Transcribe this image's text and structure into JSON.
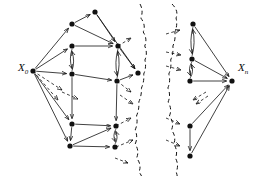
{
  "figure": {
    "type": "directed-graph-diagram",
    "background": "#ffffff",
    "ink_color": "#111111",
    "width": 260,
    "height": 176
  },
  "labels": {
    "source": {
      "base": "X",
      "sub": "0",
      "text": "X0"
    },
    "sink": {
      "base": "X",
      "sub": "n",
      "text": "Xn"
    }
  },
  "graph_data": {
    "type": "directed-graph",
    "node_style": {
      "shape": "filled-circle",
      "radius": 2.6,
      "color": "#111111"
    },
    "edge_style": {
      "color": "#111111",
      "width": 0.8,
      "arrowhead": "open-v"
    },
    "break_line_style": {
      "dash": "4 3",
      "color": "#111111",
      "width": 1.0
    },
    "nodes": [
      {
        "id": "x0",
        "x": 33,
        "y": 71,
        "label": "X0",
        "label_pos": "left"
      },
      {
        "id": "a1",
        "x": 95,
        "y": 12,
        "label": ""
      },
      {
        "id": "a2",
        "x": 72,
        "y": 24,
        "label": ""
      },
      {
        "id": "a3",
        "x": 72,
        "y": 46,
        "label": ""
      },
      {
        "id": "a4",
        "x": 118,
        "y": 46,
        "label": ""
      },
      {
        "id": "a5",
        "x": 72,
        "y": 74,
        "label": ""
      },
      {
        "id": "a6",
        "x": 117,
        "y": 81,
        "label": ""
      },
      {
        "id": "a7",
        "x": 138,
        "y": 73,
        "label": ""
      },
      {
        "id": "b1",
        "x": 72,
        "y": 124,
        "label": ""
      },
      {
        "id": "b2",
        "x": 70,
        "y": 146,
        "label": ""
      },
      {
        "id": "b3",
        "x": 116,
        "y": 126,
        "label": ""
      },
      {
        "id": "b4",
        "x": 115,
        "y": 147,
        "label": ""
      },
      {
        "id": "r1",
        "x": 193,
        "y": 24,
        "label": ""
      },
      {
        "id": "r2",
        "x": 192,
        "y": 59,
        "label": ""
      },
      {
        "id": "r3",
        "x": 190,
        "y": 81,
        "label": ""
      },
      {
        "id": "r4",
        "x": 190,
        "y": 126,
        "label": ""
      },
      {
        "id": "r5",
        "x": 190,
        "y": 156,
        "label": ""
      },
      {
        "id": "xn",
        "x": 232,
        "y": 81,
        "label": "Xn",
        "label_pos": "right"
      }
    ],
    "edges": [
      {
        "from": "x0",
        "to": "a2"
      },
      {
        "from": "x0",
        "to": "a3"
      },
      {
        "from": "x0",
        "to": "a5"
      },
      {
        "from": "x0",
        "to": "b1"
      },
      {
        "from": "x0",
        "to": "b2"
      },
      {
        "from": "a2",
        "to": "a1"
      },
      {
        "from": "a2",
        "to": "a4"
      },
      {
        "from": "a1",
        "to": "a4"
      },
      {
        "from": "a1",
        "to": "a7"
      },
      {
        "from": "a3",
        "to": "a4"
      },
      {
        "from": "a3",
        "to": "a5"
      },
      {
        "from": "a5",
        "to": "a3"
      },
      {
        "from": "a4",
        "to": "a6"
      },
      {
        "from": "a6",
        "to": "a4"
      },
      {
        "from": "a5",
        "to": "a6"
      },
      {
        "from": "a4",
        "to": "a7"
      },
      {
        "from": "a6",
        "to": "a7"
      },
      {
        "from": "b1",
        "to": "b2"
      },
      {
        "from": "b1",
        "to": "b3"
      },
      {
        "from": "b2",
        "to": "b3"
      },
      {
        "from": "b2",
        "to": "b4"
      },
      {
        "from": "b3",
        "to": "b4"
      },
      {
        "from": "b4",
        "to": "b3"
      },
      {
        "from": "a5",
        "to": "b1"
      },
      {
        "from": "a6",
        "to": "b3"
      },
      {
        "from": "r1",
        "to": "r2"
      },
      {
        "from": "r2",
        "to": "r1"
      },
      {
        "from": "r1",
        "to": "xn"
      },
      {
        "from": "r2",
        "to": "xn"
      },
      {
        "from": "r2",
        "to": "r3"
      },
      {
        "from": "r3",
        "to": "r2"
      },
      {
        "from": "r3",
        "to": "xn"
      },
      {
        "from": "r4",
        "to": "r5"
      },
      {
        "from": "r4",
        "to": "xn"
      },
      {
        "from": "r5",
        "to": "xn"
      }
    ],
    "break_lines": [
      {
        "id": "break-left",
        "x": 140
      },
      {
        "id": "break-right",
        "x": 172
      }
    ]
  }
}
